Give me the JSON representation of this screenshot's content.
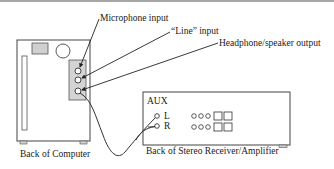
{
  "labels": {
    "microphone_input": "Microphone input",
    "line_input": "“Line” input",
    "headphone_output": "Headphone/speaker output",
    "back_of_computer": "Back of Computer",
    "back_of_receiver": "Back of Stereo Receiver/Amplifier",
    "aux": "AUX",
    "left_channel": "L",
    "right_channel": "R"
  },
  "colors": {
    "line": "#333333",
    "panel_fill": "#d4d4d4",
    "border_top": "#9a9a9a",
    "text": "#1a1a1a"
  }
}
